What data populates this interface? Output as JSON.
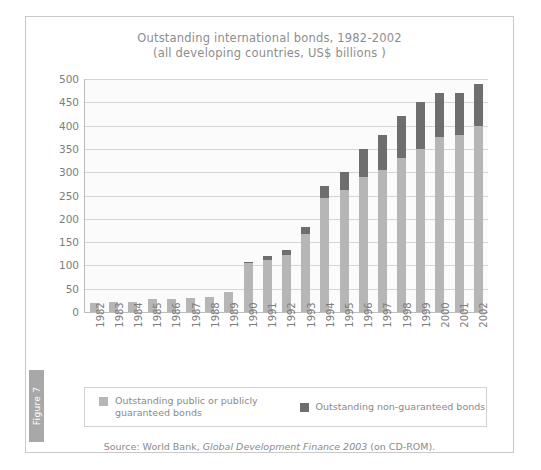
{
  "figure": {
    "tab_label": "Figure 7"
  },
  "source": {
    "prefix": "Source: World Bank, ",
    "italic": "Global Development Finance 2003",
    "suffix": " (on CD-ROM)."
  },
  "legend": {
    "items": [
      {
        "key": "light",
        "label": "Outstanding public or publicly guaranteed bonds"
      },
      {
        "key": "dark",
        "label": "Outstanding non-guaranteed bonds"
      }
    ]
  },
  "colors": {
    "public_guaranteed": "#b6b6b6",
    "non_guaranteed": "#6e6e6e",
    "gridline": "#d5d5d5",
    "axis": "#bdbdbd",
    "text": "#8a8a8a",
    "tab": "#a8a8a8"
  },
  "chart_data": {
    "type": "bar",
    "stacked": true,
    "title": "Outstanding international bonds, 1982-2002",
    "subtitle": "(all developing countries, US$ billions )",
    "xlabel": "",
    "ylabel": "",
    "ylim": [
      0,
      500
    ],
    "yticks": [
      0,
      50,
      100,
      150,
      200,
      250,
      300,
      350,
      400,
      450,
      500
    ],
    "grid": true,
    "legend_position": "bottom",
    "categories": [
      "1982",
      "1983",
      "1984",
      "1985",
      "1986",
      "1987",
      "1988",
      "1989",
      "1990",
      "1991",
      "1992",
      "1993",
      "1994",
      "1995",
      "1996",
      "1997",
      "1998",
      "1999",
      "2000",
      "2001",
      "2002"
    ],
    "series": [
      {
        "name": "Outstanding public or publicly guaranteed bonds",
        "color": "#b6b6b6",
        "values": [
          20,
          21,
          21,
          27,
          28,
          30,
          33,
          44,
          105,
          112,
          123,
          168,
          245,
          262,
          290,
          305,
          330,
          350,
          375,
          380,
          400
        ]
      },
      {
        "name": "Outstanding non-guaranteed bonds",
        "color": "#6e6e6e",
        "values": [
          0,
          0,
          0,
          0,
          0,
          0,
          0,
          0,
          3,
          8,
          10,
          14,
          25,
          38,
          60,
          75,
          90,
          100,
          95,
          90,
          90
        ]
      }
    ],
    "totals": [
      20,
      21,
      21,
      27,
      28,
      30,
      33,
      44,
      108,
      120,
      133,
      182,
      270,
      300,
      350,
      380,
      420,
      450,
      470,
      470,
      490
    ]
  }
}
